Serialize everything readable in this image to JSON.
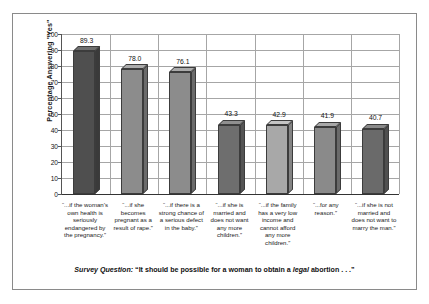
{
  "chart_data": {
    "type": "bar",
    "title": "",
    "subtitle": "",
    "xlabel": "",
    "ylabel": "Percentage Answering \"Yes\"",
    "ylim": [
      0,
      100
    ],
    "yticks": [
      0,
      10,
      20,
      30,
      40,
      50,
      60,
      70,
      80,
      90,
      100
    ],
    "grid": true,
    "legend": "none",
    "categories": [
      "“...if the woman’s own health is seriously endangered by the pregnancy.”",
      "“...if she becomes pregnant as a result of rape.”",
      "“...if there is a strong chance of a serious defect in the baby.”",
      "“...if she is married and does not want any more children.”",
      "“...if the family has a very low income and cannot afford any more children.”",
      "“...for any reason.”",
      "“...if she is not married and does not want to marry the man.”"
    ],
    "values": [
      89.3,
      78.0,
      76.1,
      43.3,
      42.9,
      41.9,
      40.7
    ],
    "value_labels": [
      "89.3",
      "78.0",
      "76.1",
      "43.3",
      "42.9",
      "41.9",
      "40.7"
    ],
    "bar_colors": [
      "#4f4f4f",
      "#8c8c8c",
      "#8c8c8c",
      "#6e6e6e",
      "#a8a8a8",
      "#8a8a8a",
      "#6a6a6a"
    ],
    "bar_top_colors": [
      "#6f6f6f",
      "#ababab",
      "#ababab",
      "#8f8f8f",
      "#c4c4c4",
      "#a8a8a8",
      "#8a8a8a"
    ],
    "bar_side_colors": [
      "#3a3a3a",
      "#6b6b6b",
      "#6b6b6b",
      "#545454",
      "#848484",
      "#6a6a6a",
      "#505050"
    ]
  },
  "caption": {
    "lead": "Survey Question:",
    "quote_open": " “It should be possible for a woman to obtain a ",
    "emphasis": "legal",
    "quote_close": " abortion . . .”"
  },
  "axis": {
    "y_title": "Percentage Answering \"Yes\""
  }
}
